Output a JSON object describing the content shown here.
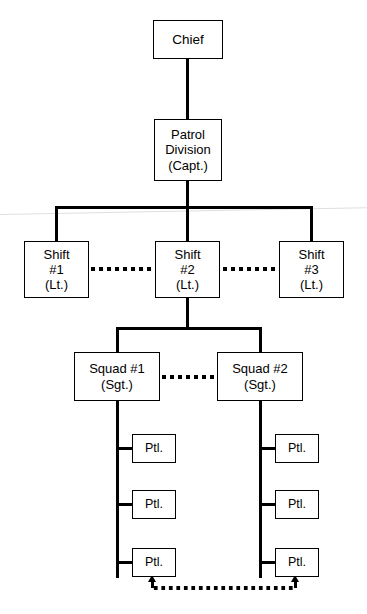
{
  "chart": {
    "type": "org-chart",
    "background_color": "#ffffff",
    "line_color": "#000000",
    "text_color": "#000000"
  },
  "nodes": {
    "chief": {
      "label": "Chief"
    },
    "division": {
      "line1": "Patrol",
      "line2": "Division",
      "line3": "(Capt.)"
    },
    "shift1": {
      "line1": "Shift",
      "line2": "#1",
      "line3": "(Lt.)"
    },
    "shift2": {
      "line1": "Shift",
      "line2": "#2",
      "line3": "(Lt.)"
    },
    "shift3": {
      "line1": "Shift",
      "line2": "#3",
      "line3": "(Lt.)"
    },
    "squad1": {
      "line1": "Squad #1",
      "line2": "(Sgt.)"
    },
    "squad2": {
      "line1": "Squad #2",
      "line2": "(Sgt.)"
    },
    "patrol_left": [
      {
        "label": "Ptl."
      },
      {
        "label": "Ptl."
      },
      {
        "label": "Ptl."
      }
    ],
    "patrol_right": [
      {
        "label": "Ptl."
      },
      {
        "label": "Ptl."
      },
      {
        "label": "Ptl."
      }
    ]
  },
  "connections": {
    "solid": [
      {
        "from": "chief",
        "to": "division"
      },
      {
        "from": "division",
        "to": "shift1"
      },
      {
        "from": "division",
        "to": "shift2"
      },
      {
        "from": "division",
        "to": "shift3"
      },
      {
        "from": "shift2",
        "to": "squad1"
      },
      {
        "from": "shift2",
        "to": "squad2"
      },
      {
        "from": "squad1",
        "to": "patrol_left"
      },
      {
        "from": "squad2",
        "to": "patrol_right"
      }
    ],
    "dotted_peer": [
      {
        "from": "shift1",
        "to": "shift2"
      },
      {
        "from": "shift2",
        "to": "shift3"
      },
      {
        "from": "squad1",
        "to": "squad2"
      }
    ],
    "dotted_bidirectional": [
      {
        "from": "patrol_left.2",
        "to": "patrol_right.2",
        "arrows": "both"
      }
    ]
  }
}
